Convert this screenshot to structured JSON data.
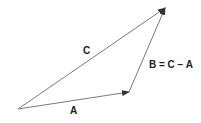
{
  "diagram": {
    "type": "vector-triangle",
    "vectors": [
      {
        "name": "A",
        "label": "A",
        "from": [
          18,
          109
        ],
        "to": [
          129,
          92
        ]
      },
      {
        "name": "B",
        "label": "B = C − A",
        "from": [
          129,
          92
        ],
        "to": [
          165,
          8
        ]
      },
      {
        "name": "C",
        "label": "C",
        "from": [
          18,
          109
        ],
        "to": [
          165,
          8
        ]
      }
    ],
    "colors": {
      "line": "#7a7a7a",
      "arrowhead": "#333333",
      "text": "#222222"
    }
  }
}
